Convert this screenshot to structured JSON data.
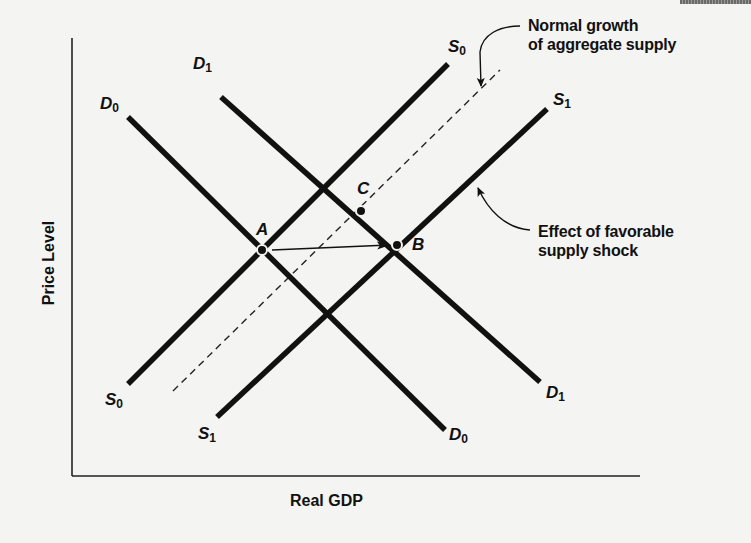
{
  "axes": {
    "x_label": "Real GDP",
    "y_label": "Price Level"
  },
  "curves": {
    "D0": {
      "name": "D",
      "sub": "0",
      "type": "aggregate demand"
    },
    "D1": {
      "name": "D",
      "sub": "1",
      "type": "aggregate demand"
    },
    "S0": {
      "name": "S",
      "sub": "0",
      "type": "aggregate supply"
    },
    "S1": {
      "name": "S",
      "sub": "1",
      "type": "aggregate supply"
    },
    "dashed": {
      "type": "normal growth of aggregate supply"
    }
  },
  "points": {
    "A": "A",
    "B": "B",
    "C": "C"
  },
  "annotations": {
    "normal_growth": {
      "line1": "Normal growth",
      "line2": "of aggregate supply"
    },
    "favorable_shock": {
      "line1": "Effect of favorable",
      "line2": "supply shock"
    }
  },
  "colors": {
    "ink": "#111111",
    "background": "#f4f4f2"
  }
}
